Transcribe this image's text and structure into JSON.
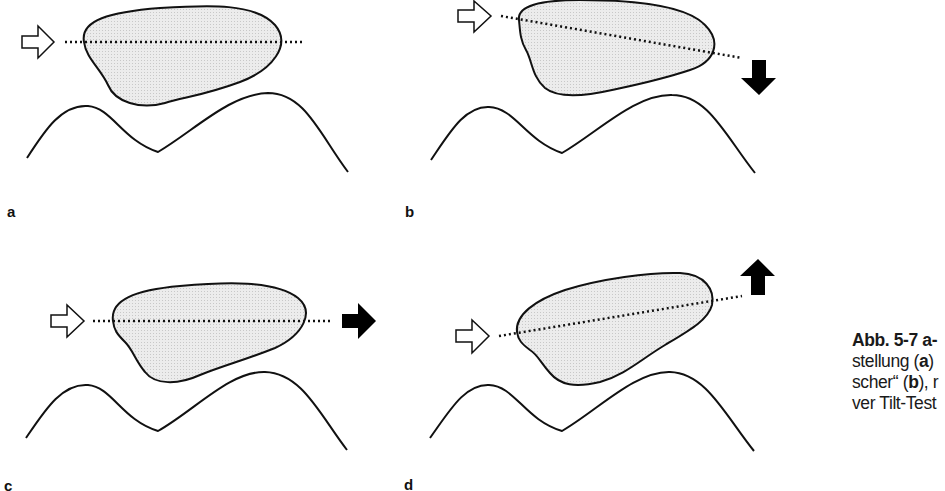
{
  "figure": {
    "panels": [
      {
        "id": "a",
        "label": "a",
        "incoming_arrow": "outline-right-arrow",
        "outgoing_arrow": null,
        "axis_tilt": "horizontal"
      },
      {
        "id": "b",
        "label": "b",
        "incoming_arrow": "outline-right-arrow",
        "outgoing_arrow": "solid-down-arrow",
        "axis_tilt": "tilted-down"
      },
      {
        "id": "c",
        "label": "c",
        "incoming_arrow": "outline-right-arrow",
        "outgoing_arrow": "solid-right-arrow",
        "axis_tilt": "horizontal"
      },
      {
        "id": "d",
        "label": "d",
        "incoming_arrow": "outline-right-arrow",
        "outgoing_arrow": "solid-up-arrow",
        "axis_tilt": "tilted-up"
      }
    ],
    "colors": {
      "outline": "#111111",
      "blob_fill": "#e4e4e4",
      "solid_arrow": "#000000",
      "background": "#ffffff"
    }
  },
  "caption": {
    "title": "Abb. 5-7 a-",
    "line1_prefix": "stellung (",
    "line1_bold": "a",
    "line1_suffix": ")",
    "line2_prefix": "scher“ (",
    "line2_bold": "b",
    "line2_suffix": "), r",
    "line3": "ver Tilt-Test"
  }
}
